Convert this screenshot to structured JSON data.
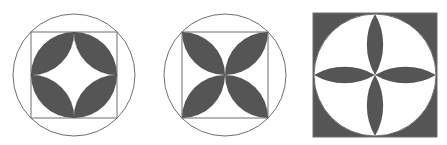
{
  "figures": [
    {
      "id": "figure-1",
      "description": "Square inscribed in circle; four semicircles on square sides inward forming shaded ring with white four-point star",
      "center": [
        74,
        75
      ],
      "circle_radius": 61,
      "square_half": 43
    },
    {
      "id": "figure-2",
      "description": "Square inscribed in circle; four shaded lens/petal shapes along diagonals meeting at center",
      "center": [
        225,
        75
      ],
      "circle_radius": 61,
      "square_half": 43
    },
    {
      "id": "figure-3",
      "description": "Shaded square with inscribed white circle; four shaded petals in a plus shape meeting at center",
      "center": [
        375,
        75
      ],
      "circle_radius": 61,
      "square_half": 61.5
    }
  ],
  "colors": {
    "fill": "#555555",
    "stroke": "#6f6f6f",
    "background": "#ffffff"
  }
}
